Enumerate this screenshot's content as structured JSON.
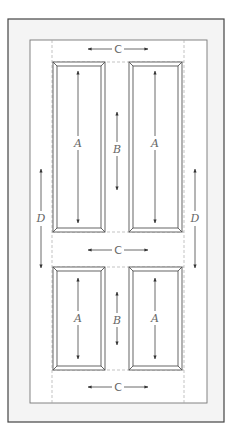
{
  "diagram": {
    "labels": {
      "panel_height": "A",
      "mullion_height": "B",
      "rail_width": "C",
      "stile_span": "D"
    },
    "colors": {
      "line": "#555555",
      "outer_frame": "#444444",
      "shade": "#f3f3f3",
      "dashed": "#aaaaaa"
    },
    "dimensions": {
      "top_rail": "C",
      "middle_rail": "C",
      "bottom_rail": "C",
      "left_stile": "D",
      "right_stile": "D",
      "top_mullion": "B",
      "bottom_mullion": "B",
      "top_left_panel": "A",
      "top_right_panel": "A",
      "bottom_left_panel": "A",
      "bottom_right_panel": "A"
    }
  }
}
